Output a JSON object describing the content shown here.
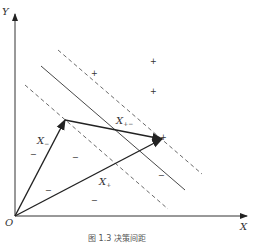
{
  "diagram": {
    "axes": {
      "x_label": "X",
      "y_label": "Y",
      "origin_label": "O"
    },
    "vectors": [
      {
        "name": "X-",
        "label": "X",
        "subscript": "−"
      },
      {
        "name": "X+",
        "label": "X",
        "subscript": "+"
      },
      {
        "name": "X+-",
        "label": "X",
        "subscript": "+−"
      }
    ],
    "positive_marks": [
      "+",
      "+",
      "+",
      "+"
    ],
    "negative_marks": [
      "−",
      "−",
      "−",
      "−",
      "−"
    ],
    "lines": [
      {
        "name": "decision-boundary",
        "style": "solid"
      },
      {
        "name": "parallel-line",
        "style": "solid"
      },
      {
        "name": "positive-margin",
        "style": "dashed"
      },
      {
        "name": "negative-margin",
        "style": "dashed"
      }
    ],
    "caption": "图 1.3 决策间距",
    "colors": {
      "line": "#333333",
      "background": "#ffffff"
    }
  }
}
